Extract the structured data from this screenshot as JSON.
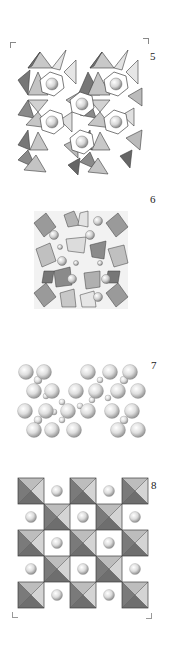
{
  "figure": {
    "panels": [
      {
        "id": "panel-5",
        "label": "5",
        "description": "polyhedral framework with large spheres in hexagonal channels"
      },
      {
        "id": "panel-6",
        "label": "6",
        "description": "dense cubic polyhedral framework with spheres"
      },
      {
        "id": "panel-7",
        "label": "7",
        "description": "ball model cluster of spheres"
      },
      {
        "id": "panel-8",
        "label": "8",
        "description": "checkerboard of square pyramids/octahedra with spheres"
      }
    ]
  },
  "colors": {
    "background": "#ffffff",
    "poly_light": "#d9d9d9",
    "poly_mid": "#a6a6a6",
    "poly_dark": "#6e6e6e",
    "sphere_hi": "#ffffff",
    "sphere_lo": "#9a9a9a",
    "outline": "#4a4a4a"
  }
}
